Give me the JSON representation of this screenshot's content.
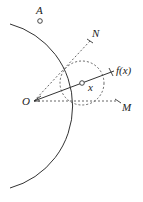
{
  "diagram": {
    "labels": {
      "A": "A",
      "N": "N",
      "fx": "f(x)",
      "x": "x",
      "O": "O",
      "M": "M"
    },
    "points": {
      "O": [
        34,
        101
      ],
      "A": [
        40,
        21
      ],
      "N": [
        90,
        41
      ],
      "fx": [
        112,
        72
      ],
      "x": [
        82,
        83
      ],
      "M": [
        118,
        101
      ]
    },
    "arc": {
      "center": [
        33,
        106
      ],
      "radius": 85
    },
    "small_circle": {
      "center": [
        82,
        83
      ],
      "radius": 22
    },
    "colors": {
      "stroke": "#333333",
      "dashed": "#555555"
    }
  }
}
